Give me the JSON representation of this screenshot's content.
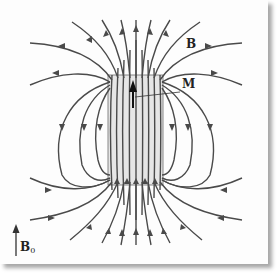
{
  "diagram": {
    "labels": {
      "field": "B",
      "magnetization": "M",
      "applied_field": "B",
      "applied_field_subscript": "0"
    },
    "colors": {
      "line": "#4a4a4a",
      "body_fill": "#e6e6e6",
      "background": "#fdfdfd",
      "shadow": "#9a9a9a"
    },
    "elements": [
      {
        "id": "magnetized-body",
        "shape": "rectangle",
        "x": 108,
        "y": 75,
        "w": 55,
        "h": 110
      },
      {
        "id": "magnetization-arrow",
        "direction": "up"
      },
      {
        "id": "applied-field-arrow",
        "direction": "up"
      },
      {
        "id": "field-lines",
        "count": "approx 30",
        "pattern": "dipole lines converging through body, emerging from top, returning around sides"
      }
    ]
  }
}
